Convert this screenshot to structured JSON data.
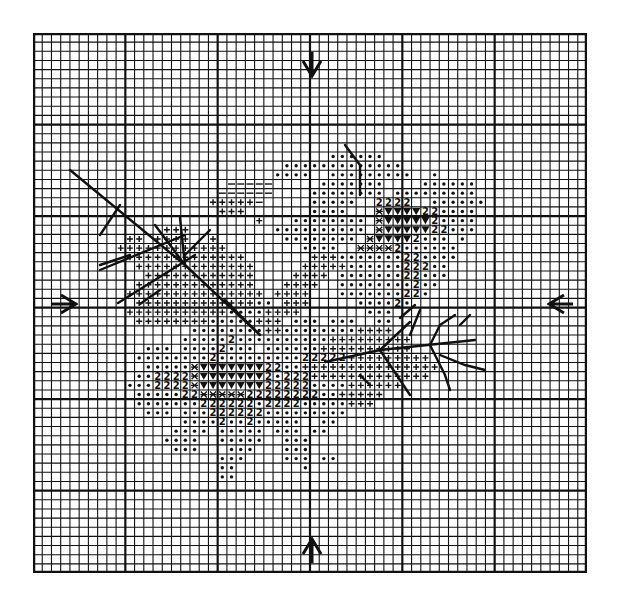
{
  "chart": {
    "grid": {
      "cols": 60,
      "rows": 59,
      "major_every": 10,
      "line_color": "#111111"
    },
    "center_markers": [
      "top-arrow",
      "bottom-arrow",
      "left-arrow",
      "right-arrow"
    ],
    "legend_symbols": [
      {
        "symbol": "dot",
        "meaning": "background petal stitch"
      },
      {
        "symbol": "2",
        "meaning": "petal shade 2"
      },
      {
        "symbol": "+",
        "meaning": "leaf stitch"
      },
      {
        "symbol": "-",
        "meaning": "light leaf stitch"
      },
      {
        "symbol": "*",
        "meaning": "flower centre stitch"
      },
      {
        "symbol": "V",
        "meaning": "dark flower centre stitch"
      }
    ],
    "rows": [
      {
        "r": 13,
        "cells": "................................dddddd"
      },
      {
        "r": 14,
        "cells": "...........................ddddddddddddd"
      },
      {
        "r": 15,
        "cells": "..........................dddd..ddddddddd..d"
      },
      {
        "r": 16,
        "cells": ".....................-----.....ddddddd....dddddd.."
      },
      {
        "r": 17,
        "cells": "....................------....dddddddd.ddddddddd"
      },
      {
        "r": 18,
        "cells": "...................+++++-.....ddddd..2222..dddddd"
      },
      {
        "r": 19,
        "cells": "....................+++.......dddd...*VVVV22dddd"
      },
      {
        "r": 20,
        "cells": "........................+...dddddddd.*VVVVV2dddd"
      },
      {
        "r": 21,
        "cells": "..............+++.........dddddddddd.*VVVVV22ddd"
      },
      {
        "r": 22,
        "cells": "..........++.++++..+.......dddddddd.*VVVV2ddd.d"
      },
      {
        "r": 23,
        "cells": ".........++++++++++++........dddd..****2dddddd"
      },
      {
        "r": 24,
        "cells": "..........+++++++++++++.......+++ddddddd22dddd"
      },
      {
        "r": 25,
        "cells": "...........+++++++++++++.....+++++dddddd222dd"
      },
      {
        "r": 26,
        "cells": "............++++++++++++....++++.ddddddd22ddd"
      },
      {
        "r": 27,
        "cells": "...........+++++++++++++...++++..dddddddd2dd"
      },
      {
        "r": 28,
        "cells": "..........+++++++++++++++.++++...ddddddd22d"
      },
      {
        "r": 29,
        "cells": "...........+++++++++++++dd.+++.....dddd2d"
      },
      {
        "r": 30,
        "cells": "..........+++++++++++dddd++++.......ddd"
      },
      {
        "r": 31,
        "cells": "...........++++++++ddddd+++.ddd.ddd..dd"
      },
      {
        "r": 32,
        "cells": ".................dddddddd++dddddddd++++"
      },
      {
        "r": 33,
        "cells": "................ddddd2dddddddddd+++++++++"
      },
      {
        "r": 34,
        "cells": "............ddd.dddd2ddd.dddddd++++++++++"
      },
      {
        "r": 35,
        "cells": "...........dddddddd2ddddddddd22222+++++++++"
      },
      {
        "r": 36,
        "cells": "............ddddd*VVVVVVV22dd+++++++++++++++"
      },
      {
        "r": 37,
        "cells": "...........dd2222*VVVVVVV2d222+++++++++++++"
      },
      {
        "r": 38,
        "cells": "..........ddd2222*VVVVVVV22222dddd++++++"
      },
      {
        "r": 39,
        "cells": "...........ddddd22*****22222222dd+++++"
      },
      {
        "r": 40,
        "cells": "...........ddddddd222222d2222ddddd+++"
      },
      {
        "r": 41,
        "cells": "............ddd.ddd222222ddddddddd"
      },
      {
        "r": 42,
        "cells": "................dddd2dd2ddddd..dd"
      },
      {
        "r": 43,
        "cells": "...............dddd.ddddd.ddd.dd"
      },
      {
        "r": 44,
        "cells": "..............dddd..ddddd..ddd"
      },
      {
        "r": 45,
        "cells": "...............ddd...ddd...ddd"
      },
      {
        "r": 46,
        "cells": "....................ddd....ddd.dd"
      },
      {
        "r": 47,
        "cells": "....................dd.......d"
      },
      {
        "r": 48,
        "cells": "....................dd"
      }
    ]
  },
  "markers": {
    "top": "down-arrow",
    "bottom": "up-arrow",
    "left": "right-arrow",
    "right": "left-arrow"
  }
}
